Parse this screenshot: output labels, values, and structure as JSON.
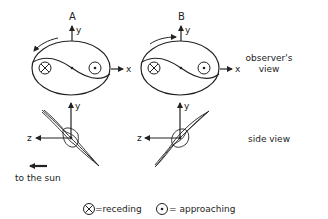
{
  "panels": {
    "a": {
      "label": "A"
    },
    "b": {
      "label": "B"
    }
  },
  "axes": {
    "x": "x",
    "y": "y",
    "z": "z"
  },
  "row_labels": {
    "observer_line1": "observer's",
    "observer_line2": "view",
    "side": "side view"
  },
  "sun": {
    "label": "to the sun"
  },
  "legend": {
    "receding": "=receding",
    "approaching": "= approaching"
  },
  "colors": {
    "ink": "#222222",
    "background": "#ffffff"
  }
}
